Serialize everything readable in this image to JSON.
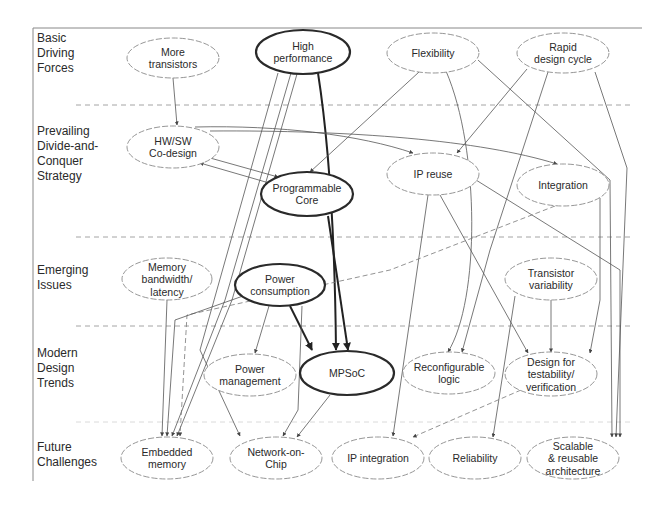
{
  "diagram": {
    "rows": [
      {
        "id": "basic",
        "label_lines": [
          "Basic",
          "Driving",
          "Forces"
        ]
      },
      {
        "id": "prevailing",
        "label_lines": [
          "Prevailing",
          "Divide-and-",
          "Conquer",
          "Strategy"
        ]
      },
      {
        "id": "emerging",
        "label_lines": [
          "Emerging",
          "Issues"
        ]
      },
      {
        "id": "modern",
        "label_lines": [
          "Modern",
          "Design",
          "Trends"
        ]
      },
      {
        "id": "future",
        "label_lines": [
          "Future",
          "Challenges"
        ]
      }
    ],
    "nodes": [
      {
        "id": "more-transistors",
        "row": "basic",
        "lines": [
          "More",
          "transistors"
        ],
        "emphasis": false
      },
      {
        "id": "high-performance",
        "row": "basic",
        "lines": [
          "High",
          "performance"
        ],
        "emphasis": true
      },
      {
        "id": "flexibility",
        "row": "basic",
        "lines": [
          "Flexibility"
        ],
        "emphasis": false
      },
      {
        "id": "rapid-design-cycle",
        "row": "basic",
        "lines": [
          "Rapid",
          "design cycle"
        ],
        "emphasis": false
      },
      {
        "id": "hw-sw-codesign",
        "row": "prevailing",
        "lines": [
          "HW/SW",
          "Co-design"
        ],
        "emphasis": false
      },
      {
        "id": "programmable-core",
        "row": "prevailing",
        "lines": [
          "Programmable",
          "Core"
        ],
        "emphasis": true
      },
      {
        "id": "ip-reuse",
        "row": "prevailing",
        "lines": [
          "IP reuse"
        ],
        "emphasis": false
      },
      {
        "id": "integration",
        "row": "prevailing",
        "lines": [
          "Integration"
        ],
        "emphasis": false
      },
      {
        "id": "memory-bandwidth",
        "row": "emerging",
        "lines": [
          "Memory",
          "bandwidth/",
          "latency"
        ],
        "emphasis": false
      },
      {
        "id": "power-consumption",
        "row": "emerging",
        "lines": [
          "Power",
          "consumption"
        ],
        "emphasis": true
      },
      {
        "id": "transistor-variability",
        "row": "emerging",
        "lines": [
          "Transistor",
          "variability"
        ],
        "emphasis": false
      },
      {
        "id": "power-management",
        "row": "modern",
        "lines": [
          "Power",
          "management"
        ],
        "emphasis": false
      },
      {
        "id": "mpsoc",
        "row": "modern",
        "lines": [
          "MPSoC"
        ],
        "emphasis": true
      },
      {
        "id": "reconfigurable-logic",
        "row": "modern",
        "lines": [
          "Reconfigurable",
          "logic"
        ],
        "emphasis": false
      },
      {
        "id": "design-for-testability",
        "row": "modern",
        "lines": [
          "Design for",
          "testability/",
          "verification"
        ],
        "emphasis": false
      },
      {
        "id": "embedded-memory",
        "row": "future",
        "lines": [
          "Embedded",
          "memory"
        ],
        "emphasis": false
      },
      {
        "id": "network-on-chip",
        "row": "future",
        "lines": [
          "Network-on-",
          "Chip"
        ],
        "emphasis": false
      },
      {
        "id": "ip-integration",
        "row": "future",
        "lines": [
          "IP integration"
        ],
        "emphasis": false
      },
      {
        "id": "reliability",
        "row": "future",
        "lines": [
          "Reliability"
        ],
        "emphasis": false
      },
      {
        "id": "scalable-architecture",
        "row": "future",
        "lines": [
          "Scalable",
          "& reusable",
          "architecture"
        ],
        "emphasis": false
      }
    ],
    "edges": [
      {
        "from": "more-transistors",
        "to": "hw-sw-codesign",
        "style": "thin"
      },
      {
        "from": "high-performance",
        "to": "mpsoc",
        "style": "bold"
      },
      {
        "from": "high-performance",
        "to": "embedded-memory",
        "style": "thin"
      },
      {
        "from": "high-performance",
        "to": "embedded-memory",
        "style": "thin"
      },
      {
        "from": "flexibility",
        "to": "programmable-core",
        "style": "thin"
      },
      {
        "from": "flexibility",
        "to": "reconfigurable-logic",
        "style": "thin"
      },
      {
        "from": "flexibility",
        "to": "scalable-architecture",
        "style": "thin"
      },
      {
        "from": "rapid-design-cycle",
        "to": "ip-reuse",
        "style": "thin"
      },
      {
        "from": "rapid-design-cycle",
        "to": "reconfigurable-logic",
        "style": "thin"
      },
      {
        "from": "rapid-design-cycle",
        "to": "scalable-architecture",
        "style": "thin"
      },
      {
        "from": "hw-sw-codesign",
        "to": "programmable-core",
        "style": "thin"
      },
      {
        "from": "programmable-core",
        "to": "hw-sw-codesign",
        "style": "thin"
      },
      {
        "from": "hw-sw-codesign",
        "to": "ip-reuse",
        "style": "thin"
      },
      {
        "from": "hw-sw-codesign",
        "to": "integration",
        "style": "thin"
      },
      {
        "from": "programmable-core",
        "to": "mpsoc",
        "style": "bold"
      },
      {
        "from": "ip-reuse",
        "to": "ip-integration",
        "style": "thin"
      },
      {
        "from": "ip-reuse",
        "to": "design-for-testability",
        "style": "thin"
      },
      {
        "from": "ip-reuse",
        "to": "scalable-architecture",
        "style": "thin"
      },
      {
        "from": "integration",
        "to": "embedded-memory",
        "style": "dashed"
      },
      {
        "from": "integration",
        "to": "design-for-testability",
        "style": "thin"
      },
      {
        "from": "memory-bandwidth",
        "to": "embedded-memory",
        "style": "thin"
      },
      {
        "from": "power-consumption",
        "to": "mpsoc",
        "style": "bold"
      },
      {
        "from": "power-consumption",
        "to": "power-management",
        "style": "thin"
      },
      {
        "from": "power-consumption",
        "to": "embedded-memory",
        "style": "thin"
      },
      {
        "from": "power-consumption",
        "to": "network-on-chip",
        "style": "thin"
      },
      {
        "from": "transistor-variability",
        "to": "design-for-testability",
        "style": "thin"
      },
      {
        "from": "transistor-variability",
        "to": "reliability",
        "style": "thin"
      },
      {
        "from": "mpsoc",
        "to": "network-on-chip",
        "style": "thin"
      },
      {
        "from": "design-for-testability",
        "to": "ip-integration",
        "style": "dashed"
      },
      {
        "from": "high-performance",
        "to": "network-on-chip",
        "style": "thin"
      }
    ]
  }
}
